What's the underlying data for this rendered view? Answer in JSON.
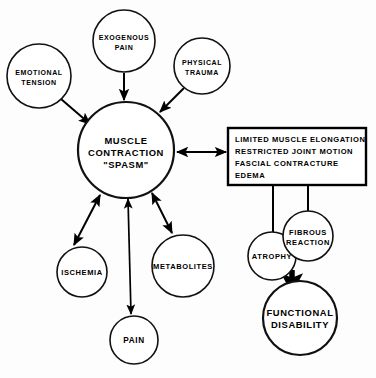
{
  "diagram": {
    "type": "flow-diagram",
    "colors": {
      "background": "#fdfdfd",
      "stroke": "#000000",
      "fill": "#ffffff",
      "text": "#000000"
    },
    "nodes": [
      {
        "id": "emotional-tension",
        "shape": "circle",
        "lines": [
          "EMOTIONAL",
          "TENSION"
        ],
        "line1": "EMOTIONAL",
        "line2": "TENSION",
        "cx": 39,
        "cy": 76,
        "r": 32
      },
      {
        "id": "exogenous-pain",
        "shape": "circle",
        "lines": [
          "EXOGENOUS",
          "PAIN"
        ],
        "line1": "EXOGENOUS",
        "line2": "PAIN",
        "cx": 124,
        "cy": 41,
        "r": 31
      },
      {
        "id": "physical-trauma",
        "shape": "circle",
        "lines": [
          "PHYSICAL",
          "TRAUMA"
        ],
        "line1": "PHYSICAL",
        "line2": "TRAUMA",
        "cx": 202,
        "cy": 66,
        "r": 28
      },
      {
        "id": "muscle-contraction-spasm",
        "shape": "circle",
        "lines": [
          "MUSCLE",
          "CONTRACTION",
          "\"SPASM\""
        ],
        "line1": "MUSCLE",
        "line2": "CONTRACTION",
        "line3": "\"SPASM\"",
        "cx": 126,
        "cy": 150,
        "r": 48
      },
      {
        "id": "ischemia",
        "shape": "circle",
        "lines": [
          "ISCHEMIA"
        ],
        "line1": "ISCHEMIA",
        "cx": 82,
        "cy": 272,
        "r": 25
      },
      {
        "id": "metabolites",
        "shape": "circle",
        "lines": [
          "METABOLITES"
        ],
        "line1": "METABOLITES",
        "cx": 183,
        "cy": 266,
        "r": 31
      },
      {
        "id": "pain",
        "shape": "circle",
        "lines": [
          "PAIN"
        ],
        "line1": "PAIN",
        "cx": 134,
        "cy": 340,
        "r": 24
      },
      {
        "id": "consequences-box",
        "shape": "rect",
        "lines": [
          "LIMITED MUSCLE ELONGATION",
          "RESTRICTED JOINT MOTION",
          "FASCIAL CONTRACTURE",
          "EDEMA"
        ],
        "x": 228,
        "y": 128,
        "width": 138,
        "height": 57
      },
      {
        "id": "atrophy",
        "shape": "circle",
        "lines": [
          "ATROPHY"
        ],
        "line1": "ATROPHY",
        "cx": 272,
        "cy": 256,
        "r": 24
      },
      {
        "id": "fibrous-reaction",
        "shape": "circle",
        "lines": [
          "FIBROUS",
          "REACTION"
        ],
        "line1": "FIBROUS",
        "line2": "REACTION",
        "cx": 308,
        "cy": 236,
        "r": 25
      },
      {
        "id": "functional-disability",
        "shape": "circle",
        "lines": [
          "FUNCTIONAL",
          "DISABILITY"
        ],
        "line1": "FUNCTIONAL",
        "line2": "DISABILITY",
        "cx": 300,
        "cy": 318,
        "r": 37
      }
    ],
    "edges": [
      {
        "id": "emotional-tension-to-spasm",
        "from": "emotional-tension",
        "to": "muscle-contraction-spasm",
        "arrow": "single"
      },
      {
        "id": "exogenous-pain-to-spasm",
        "from": "exogenous-pain",
        "to": "muscle-contraction-spasm",
        "arrow": "single"
      },
      {
        "id": "physical-trauma-to-spasm",
        "from": "physical-trauma",
        "to": "muscle-contraction-spasm",
        "arrow": "single"
      },
      {
        "id": "spasm-to-consequences-box",
        "from": "muscle-contraction-spasm",
        "to": "consequences-box",
        "arrow": "double"
      },
      {
        "id": "spasm-to-ischemia",
        "from": "muscle-contraction-spasm",
        "to": "ischemia",
        "arrow": "double"
      },
      {
        "id": "spasm-to-pain",
        "from": "muscle-contraction-spasm",
        "to": "pain",
        "arrow": "double"
      },
      {
        "id": "spasm-to-metabolites",
        "from": "muscle-contraction-spasm",
        "to": "metabolites",
        "arrow": "double"
      },
      {
        "id": "box-to-atrophy",
        "from": "consequences-box",
        "to": "atrophy",
        "arrow": "single"
      },
      {
        "id": "box-to-fibrous-reaction",
        "from": "consequences-box",
        "to": "fibrous-reaction",
        "arrow": "single"
      },
      {
        "id": "atrophy-to-functional-disability",
        "from": "atrophy",
        "to": "functional-disability",
        "arrow": "single-heavy"
      }
    ]
  },
  "caption": {
    "text": ""
  }
}
